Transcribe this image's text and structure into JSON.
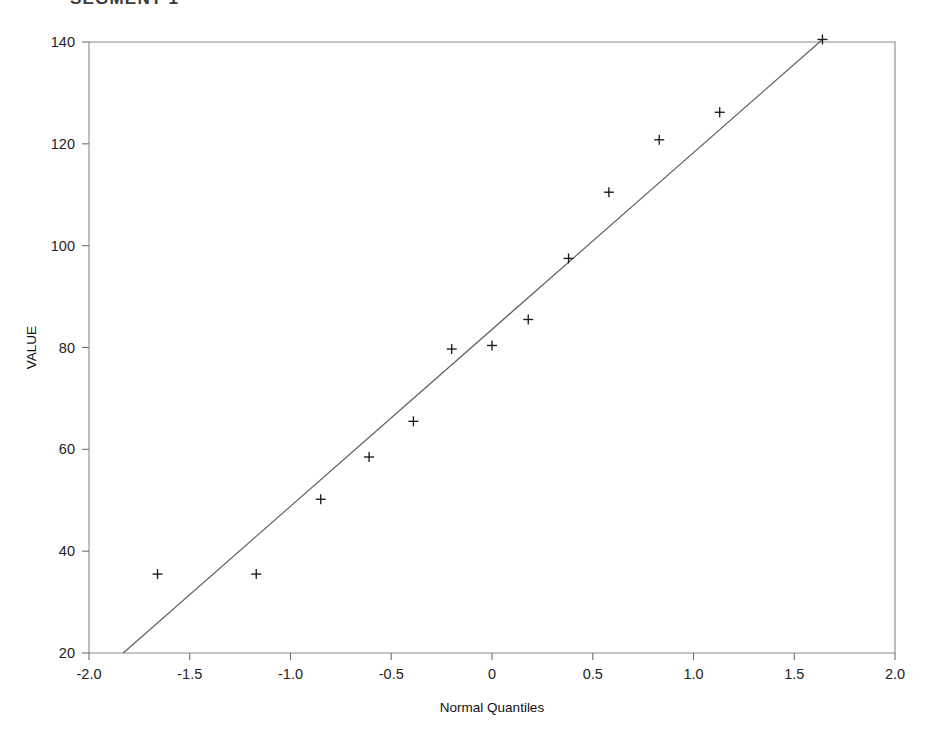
{
  "figure": {
    "title": "SEGMENT 1",
    "title_note": "clipped at top edge",
    "background": "#ffffff",
    "ink_color": "#1b1b1b",
    "axis_color": "#8b8b8b",
    "line_color": "#5b5b5b"
  },
  "chart_data": {
    "type": "scatter",
    "title": "SEGMENT 1",
    "subtitle": "",
    "xlabel": "Normal Quantiles",
    "ylabel": "VALUE",
    "xlim": [
      -2.0,
      2.0
    ],
    "ylim": [
      20,
      140
    ],
    "xticks": [
      -2.0,
      -1.5,
      -1.0,
      -0.5,
      0,
      0.5,
      1.0,
      1.5,
      2.0
    ],
    "xticklabels": [
      "-2.0",
      "-1.5",
      "-1.0",
      "-0.5",
      "0",
      "0.5",
      "1.0",
      "1.5",
      "2.0"
    ],
    "yticks": [
      20,
      40,
      60,
      80,
      100,
      120,
      140
    ],
    "yticklabels": [
      "20",
      "40",
      "60",
      "80",
      "100",
      "120",
      "140"
    ],
    "grid": false,
    "legend": null,
    "legend_position": "none",
    "marker": "plus",
    "series": [
      {
        "name": "VALUE",
        "x": [
          -1.66,
          -1.17,
          -0.85,
          -0.61,
          -0.39,
          -0.2,
          0.0,
          0.18,
          0.38,
          0.58,
          0.83,
          1.13,
          1.64
        ],
        "y": [
          35.5,
          35.5,
          50.2,
          58.5,
          65.5,
          79.7,
          80.4,
          85.5,
          97.5,
          110.5,
          120.8,
          126.2,
          140.5
        ]
      }
    ],
    "reference_line": {
      "name": "normal reference line",
      "x": [
        -1.83,
        1.64
      ],
      "y": [
        20.0,
        140.5
      ],
      "slope": 34.7,
      "intercept": 83.5
    },
    "n_points": 13
  }
}
